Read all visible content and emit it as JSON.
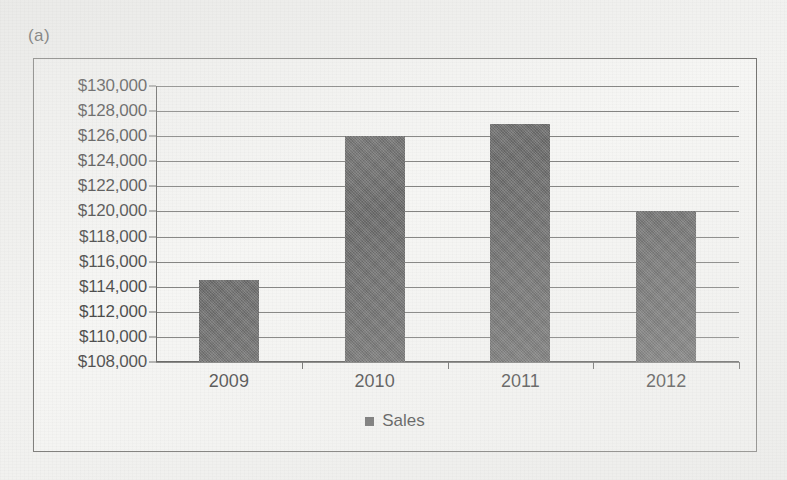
{
  "figure": {
    "label": "(a)"
  },
  "legend": {
    "position": "bottom",
    "marker_icon": "square-marker-icon",
    "entries": [
      "Sales"
    ]
  },
  "chart_data": {
    "type": "bar",
    "title": "",
    "subtitle": "",
    "xlabel": "",
    "ylabel": "",
    "categories": [
      "2009",
      "2010",
      "2011",
      "2012"
    ],
    "series": [
      {
        "name": "Sales",
        "values": [
          114500,
          126000,
          127000,
          120000
        ],
        "color": "#4a4a4a"
      }
    ],
    "ylim": [
      108000,
      130000
    ],
    "ytick_step": 2000,
    "ytick_labels": [
      "$130,000",
      "$128,000",
      "$126,000",
      "$124,000",
      "$122,000",
      "$120,000",
      "$118,000",
      "$116,000",
      "$114,000",
      "$112,000",
      "$110,000",
      "$108,000"
    ],
    "ytick_values": [
      130000,
      128000,
      126000,
      124000,
      122000,
      120000,
      118000,
      116000,
      114000,
      112000,
      110000,
      108000
    ],
    "grid": true,
    "legend_position": "bottom"
  }
}
